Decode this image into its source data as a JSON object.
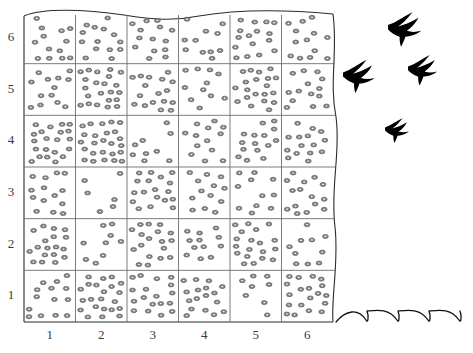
{
  "figure": {
    "kind": "quadrat-sampling-grid",
    "grid": {
      "columns": 6,
      "rows": 6
    },
    "colors": {
      "dot_fill": "#8a8a8a",
      "dot_stroke": "#5e5e5e",
      "grid_line": "#6e6e6e",
      "border_line": "#2b2b2b",
      "bird_fill": "#000000",
      "wave_line": "#111111",
      "label_color": "#3a3a3a",
      "background": "#ffffff"
    },
    "x_axis": {
      "name": "quadrat-column-numbers",
      "ticks": [
        "1",
        "2",
        "3",
        "4",
        "5",
        "6"
      ]
    },
    "y_axis": {
      "name": "quadrat-row-numbers",
      "ticks": [
        "6",
        "5",
        "4",
        "3",
        "2",
        "1"
      ]
    },
    "dot_counts": [
      [
        13,
        14,
        14,
        11,
        16,
        13
      ],
      [
        13,
        22,
        17,
        11,
        20,
        14
      ],
      [
        22,
        28,
        9,
        13,
        15,
        15
      ],
      [
        14,
        6,
        18,
        13,
        11,
        15
      ],
      [
        18,
        9,
        18,
        12,
        19,
        10
      ],
      [
        14,
        22,
        18,
        17,
        8,
        19
      ]
    ],
    "birds": [
      {
        "name": "bird-silhouette-1",
        "x": 388,
        "y": 12,
        "scale": 1.0
      },
      {
        "name": "bird-silhouette-2",
        "x": 408,
        "y": 55,
        "scale": 0.88
      },
      {
        "name": "bird-silhouette-3",
        "x": 343,
        "y": 60,
        "scale": 0.95
      },
      {
        "name": "bird-silhouette-4",
        "x": 385,
        "y": 118,
        "scale": 0.72
      }
    ],
    "waves": {
      "count": 4,
      "label": "wave-marks"
    }
  }
}
